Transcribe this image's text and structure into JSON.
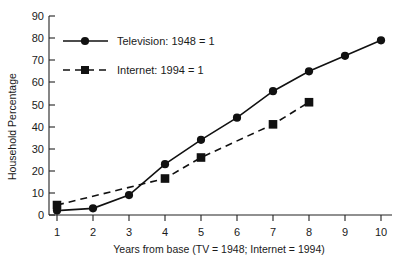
{
  "chart_data": {
    "type": "line",
    "title": "",
    "xlabel": "Years from base (TV = 1948; Internet = 1994)",
    "ylabel": "Household Percentage",
    "xlim": [
      0.6,
      10.6
    ],
    "ylim": [
      0,
      90
    ],
    "grid": false,
    "legend_position": "top-left",
    "x_ticks": [
      "1",
      "2",
      "3",
      "4",
      "5",
      "6",
      "7",
      "8",
      "9",
      "10"
    ],
    "y_ticks": [
      "0",
      "10",
      "20",
      "30",
      "40",
      "50",
      "60",
      "70",
      "80",
      "90"
    ],
    "x": [
      1,
      2,
      3,
      4,
      5,
      6,
      7,
      8,
      9,
      10
    ],
    "series": [
      {
        "name": "Television: 1948 = 1",
        "marker": "circle",
        "line_style": "solid",
        "color": "#111111",
        "x": [
          1,
          2,
          3,
          4,
          5,
          6,
          7,
          8,
          9,
          10
        ],
        "values": [
          2,
          3,
          9,
          23,
          34,
          44,
          56,
          65,
          72,
          79
        ]
      },
      {
        "name": "Internet: 1994 = 1",
        "marker": "square",
        "line_style": "dashed",
        "color": "#111111",
        "x": [
          1,
          4,
          5,
          7,
          8
        ],
        "values": [
          4.5,
          16.5,
          26,
          41,
          51
        ]
      }
    ]
  },
  "legend": {
    "items": [
      {
        "label": "Television: 1948 = 1",
        "marker": "circle",
        "line_style": "solid"
      },
      {
        "label": "Internet: 1994 = 1",
        "marker": "square",
        "line_style": "dashed"
      }
    ]
  },
  "axes": {
    "y_label": "Household Percentage",
    "x_label": "Years from base (TV = 1948; Internet = 1994)"
  }
}
